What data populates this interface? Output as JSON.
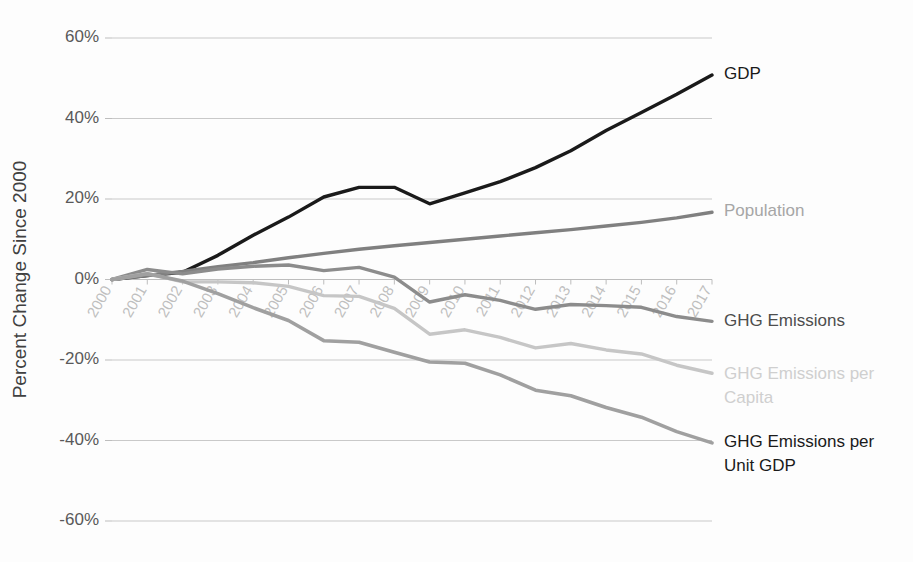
{
  "chart_data": {
    "type": "line",
    "title": "",
    "xlabel": "",
    "ylabel": "Percent Change Since 2000",
    "ylim": [
      -60,
      60
    ],
    "ytick_labels": [
      "60%",
      "40%",
      "20%",
      "0%",
      "-20%",
      "-40%",
      "-60%"
    ],
    "yticks": [
      60,
      40,
      20,
      0,
      -20,
      -40,
      -60
    ],
    "grid": true,
    "legend_position": "right-inline",
    "categories": [
      "2000",
      "2001",
      "2002",
      "2003",
      "2004",
      "2005",
      "2006",
      "2007",
      "2008",
      "2009",
      "2010",
      "2011",
      "2012",
      "2013",
      "2014",
      "2015",
      "2016",
      "2017"
    ],
    "series": [
      {
        "name": "GDP",
        "color": "#1a1a1a",
        "width": 3.4,
        "label_color": "#1a1a1a",
        "values": [
          0,
          1.0,
          1.8,
          6.0,
          11.0,
          15.5,
          20.5,
          22.9,
          22.9,
          18.8,
          21.5,
          24.3,
          27.8,
          32.0,
          37.0,
          41.5,
          46.0,
          50.8
        ]
      },
      {
        "name": "Population",
        "color": "#808080",
        "width": 3.4,
        "label_color": "#a6a6a6",
        "values": [
          0,
          1.0,
          2.0,
          3.2,
          4.2,
          5.4,
          6.5,
          7.5,
          8.4,
          9.2,
          10.0,
          10.8,
          11.6,
          12.4,
          13.3,
          14.2,
          15.3,
          16.7
        ]
      },
      {
        "name": "GHG Emissions",
        "color": "#8c8c8c",
        "width": 3.4,
        "label_color": "#4d4d4d",
        "values": [
          0,
          2.5,
          1.4,
          2.6,
          3.3,
          3.6,
          2.2,
          3.0,
          0.6,
          -5.6,
          -3.8,
          -5.2,
          -7.4,
          -6.2,
          -6.5,
          -6.9,
          -9.2,
          -10.4
        ]
      },
      {
        "name": "GHG Emissions per Capita",
        "color": "#c6c6c6",
        "width": 3.4,
        "label_color": "#cfcfcf",
        "values": [
          0,
          1.5,
          -0.6,
          -0.6,
          -0.8,
          -1.7,
          -4.0,
          -4.2,
          -7.2,
          -13.6,
          -12.5,
          -14.4,
          -17.0,
          -15.9,
          -17.5,
          -18.5,
          -21.3,
          -23.3
        ]
      },
      {
        "name": "GHG Emissions per Unit GDP",
        "color": "#a0a0a0",
        "width": 3.6,
        "label_color": "#1a1a1a",
        "values": [
          0,
          1.4,
          -0.4,
          -3.5,
          -7.0,
          -10.2,
          -15.2,
          -15.6,
          -18.1,
          -20.5,
          -20.8,
          -23.7,
          -27.5,
          -28.9,
          -31.8,
          -34.2,
          -37.8,
          -40.6
        ]
      }
    ],
    "series_labels": [
      {
        "text": "GDP",
        "lines": [
          "GDP"
        ],
        "y_pct": 51.0
      },
      {
        "text": "Population",
        "lines": [
          "Population"
        ],
        "y_pct": 17.0
      },
      {
        "text": "GHG Emissions",
        "lines": [
          "GHG Emissions"
        ],
        "y_pct": -10.5
      },
      {
        "text": "GHG Emissions per Capita",
        "lines": [
          "GHG Emissions per",
          "Capita"
        ],
        "y_pct": -23.5
      },
      {
        "text": "GHG Emissions per Unit GDP",
        "lines": [
          "GHG Emissions per",
          "Unit GDP"
        ],
        "y_pct": -40.5
      }
    ]
  }
}
